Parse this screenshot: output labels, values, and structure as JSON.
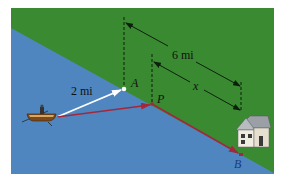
{
  "figure": {
    "colors": {
      "land": "#3a8a32",
      "water": "#4f86c0",
      "path_red": "#a3283c",
      "direct_white": "#ffffff",
      "dimension_line": "#0d1f0d"
    },
    "labels": {
      "point_a": "A",
      "point_p": "P",
      "point_b": "B",
      "distance_offshore": "2 mi",
      "distance_shore": "6 mi",
      "distance_x": "x"
    },
    "icons": {
      "boat": "rowboat-icon",
      "house": "house-icon"
    }
  }
}
